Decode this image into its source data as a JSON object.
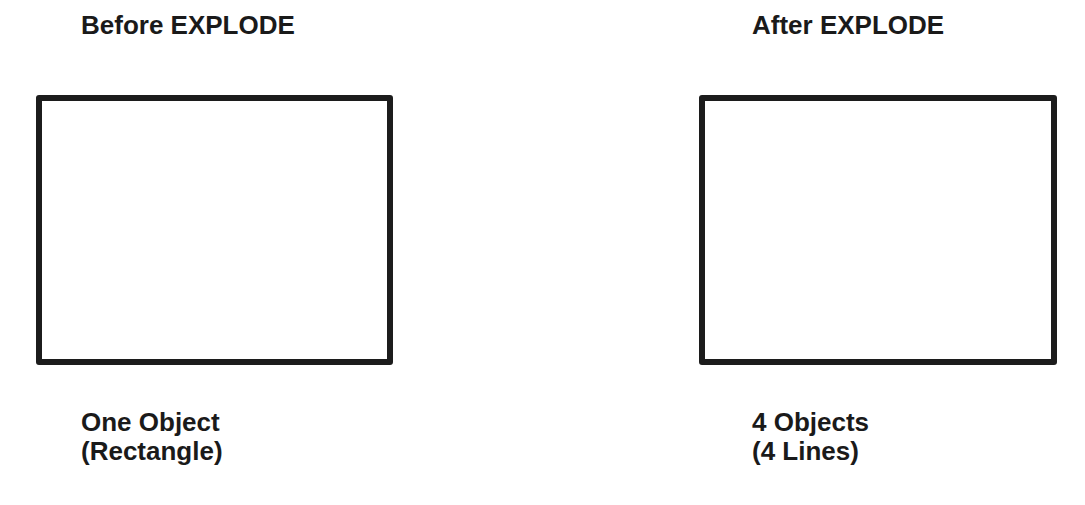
{
  "left": {
    "title": "Before EXPLODE",
    "caption_line1": "One Object",
    "caption_line2": "(Rectangle)"
  },
  "right": {
    "title": "After EXPLODE",
    "caption_line1": "4 Objects",
    "caption_line2": "(4 Lines)"
  }
}
